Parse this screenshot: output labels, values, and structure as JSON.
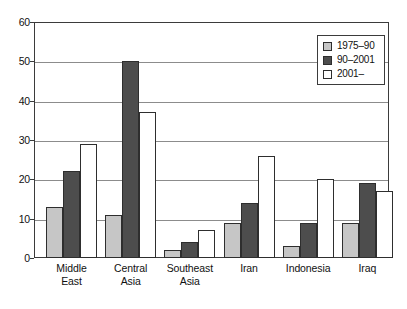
{
  "chart_data": {
    "type": "bar",
    "title": "",
    "subtitle": "",
    "xlabel": "",
    "ylabel": "",
    "ylim": [
      0,
      60
    ],
    "ytick_step": 10,
    "yticks": [
      "0",
      "10",
      "20",
      "30",
      "40",
      "50",
      "60"
    ],
    "grid": true,
    "legend_position": "top-right",
    "categories": [
      "Middle\nEast",
      "Central\nAsia",
      "Southeast\nAsia",
      "Iran",
      "Indonesia",
      "Iraq"
    ],
    "series": [
      {
        "name": "1975–90",
        "color": "#c6c6c6",
        "values": [
          13,
          11,
          2,
          9,
          3,
          9
        ]
      },
      {
        "name": "90–2001",
        "color": "#4d4d4d",
        "values": [
          22,
          50,
          4,
          14,
          9,
          19
        ]
      },
      {
        "name": "2001–",
        "color": "#ffffff",
        "values": [
          29,
          37,
          7,
          26,
          20,
          17
        ]
      }
    ]
  },
  "legend": {
    "entries": [
      {
        "label": "1975–90"
      },
      {
        "label": "90–2001"
      },
      {
        "label": "2001–"
      }
    ]
  },
  "axis": {
    "y_ticks": [
      {
        "label": "60",
        "value": 60
      },
      {
        "label": "50",
        "value": 50
      },
      {
        "label": "40",
        "value": 40
      },
      {
        "label": "30",
        "value": 30
      },
      {
        "label": "20",
        "value": 20
      },
      {
        "label": "10",
        "value": 10
      },
      {
        "label": "0",
        "value": 0
      }
    ],
    "x_categories": [
      {
        "label": "Middle\nEast"
      },
      {
        "label": "Central\nAsia"
      },
      {
        "label": "Southeast\nAsia"
      },
      {
        "label": "Iran"
      },
      {
        "label": "Indonesia"
      },
      {
        "label": "Iraq"
      }
    ]
  },
  "colors": {
    "series_1975_90": "#c6c6c6",
    "series_90_2001": "#4d4d4d",
    "series_2001_on": "#ffffff",
    "axis": "#3b3b3b",
    "gridline": "#8c8c8c",
    "bar_outline": "#2e2e2e",
    "background": "#ffffff"
  }
}
